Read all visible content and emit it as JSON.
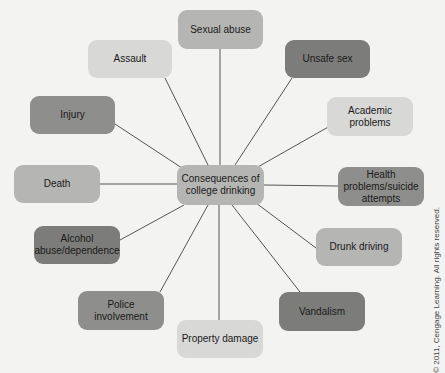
{
  "diagram": {
    "center": {
      "label": "Consequences of college drinking",
      "tone": "mid"
    },
    "nodes": [
      {
        "id": "sexual-abuse",
        "label": "Sexual abuse",
        "tone": "mid"
      },
      {
        "id": "unsafe-sex",
        "label": "Unsafe sex",
        "tone": "darker"
      },
      {
        "id": "academic-problems",
        "label": "Academic problems",
        "tone": "light"
      },
      {
        "id": "health-problems",
        "label": "Health problems/suicide attempts",
        "tone": "dark"
      },
      {
        "id": "drunk-driving",
        "label": "Drunk driving",
        "tone": "mid"
      },
      {
        "id": "vandalism",
        "label": "Vandalism",
        "tone": "darker"
      },
      {
        "id": "property-damage",
        "label": "Property damage",
        "tone": "light"
      },
      {
        "id": "police-involvement",
        "label": "Police involvement",
        "tone": "dark"
      },
      {
        "id": "alcohol-abuse",
        "label": "Alcohol abuse/dependence",
        "tone": "darker"
      },
      {
        "id": "death",
        "label": "Death",
        "tone": "mid"
      },
      {
        "id": "injury",
        "label": "Injury",
        "tone": "dark"
      },
      {
        "id": "assault",
        "label": "Assault",
        "tone": "light"
      }
    ],
    "copyright": "© 2011, Cengage Learning. All rights reserved."
  }
}
